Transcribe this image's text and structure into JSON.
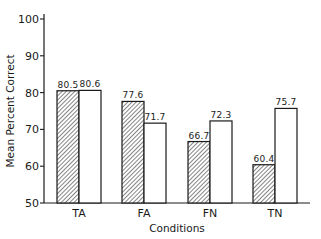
{
  "chart_data": {
    "type": "bar",
    "title": "",
    "xlabel": "Conditions",
    "ylabel": "Mean Percent Correct",
    "ylim": [
      50,
      100
    ],
    "yticks": [
      50,
      60,
      70,
      80,
      90,
      100
    ],
    "grid": false,
    "legend": null,
    "categories": [
      "TA",
      "FA",
      "FN",
      "TN"
    ],
    "series": [
      {
        "name": "hatched",
        "pattern": "diagonal-hatch",
        "values": [
          80.5,
          77.6,
          66.7,
          60.4
        ]
      },
      {
        "name": "open",
        "pattern": "none",
        "values": [
          80.6,
          71.7,
          72.3,
          75.7
        ]
      }
    ],
    "colors": {
      "ink": "#1a1a1a",
      "background": "#ffffff"
    }
  }
}
